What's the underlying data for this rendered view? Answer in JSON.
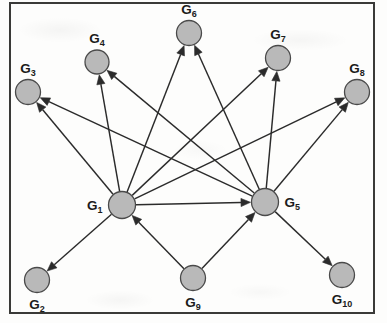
{
  "figure": {
    "kind": "directed-graph-diagram",
    "width": 387,
    "height": 323,
    "background_color": "#fdfdfc",
    "frame": {
      "border_color": "#3a3a38",
      "border_width": 2,
      "x": 9,
      "y": 2,
      "width": 366,
      "height": 312
    },
    "style": {
      "node_fill": "#b9b9b9",
      "node_stroke": "#4a4a4a",
      "edge_color": "#2b2b2b",
      "label_color": "#1b1b1b"
    }
  },
  "graph": {
    "nodes": [
      {
        "id": "G1",
        "base": "G",
        "sub": "1",
        "label": "G1",
        "cx": 122,
        "cy": 205,
        "r": 13.5,
        "label_pos": "left"
      },
      {
        "id": "G2",
        "base": "G",
        "sub": "2",
        "label": "G2",
        "cx": 37,
        "cy": 280,
        "r": 12.5,
        "label_pos": "below"
      },
      {
        "id": "G3",
        "base": "G",
        "sub": "3",
        "label": "G3",
        "cx": 28,
        "cy": 92,
        "r": 12.5,
        "label_pos": "above"
      },
      {
        "id": "G4",
        "base": "G",
        "sub": "4",
        "label": "G4",
        "cx": 97,
        "cy": 62,
        "r": 12.0,
        "label_pos": "above"
      },
      {
        "id": "G5",
        "base": "G",
        "sub": "5",
        "label": "G5",
        "cx": 265,
        "cy": 202,
        "r": 13.5,
        "label_pos": "right"
      },
      {
        "id": "G6",
        "base": "G",
        "sub": "6",
        "label": "G6",
        "cx": 189,
        "cy": 33,
        "r": 12.5,
        "label_pos": "above"
      },
      {
        "id": "G7",
        "base": "G",
        "sub": "7",
        "label": "G7",
        "cx": 278,
        "cy": 58,
        "r": 12.5,
        "label_pos": "above"
      },
      {
        "id": "G8",
        "base": "G",
        "sub": "8",
        "label": "G8",
        "cx": 357,
        "cy": 92,
        "r": 12.5,
        "label_pos": "above"
      },
      {
        "id": "G9",
        "base": "G",
        "sub": "9",
        "label": "G9",
        "cx": 193,
        "cy": 278,
        "r": 12.5,
        "label_pos": "below"
      },
      {
        "id": "G10",
        "base": "G",
        "sub": "10",
        "label": "G10",
        "cx": 342,
        "cy": 275,
        "r": 12.5,
        "label_pos": "below"
      }
    ],
    "edges": [
      {
        "from": "G1",
        "to": "G3",
        "directed": true
      },
      {
        "from": "G1",
        "to": "G4",
        "directed": true
      },
      {
        "from": "G1",
        "to": "G6",
        "directed": true
      },
      {
        "from": "G1",
        "to": "G7",
        "directed": true
      },
      {
        "from": "G1",
        "to": "G8",
        "directed": true
      },
      {
        "from": "G1",
        "to": "G5",
        "directed": true
      },
      {
        "from": "G1",
        "to": "G2",
        "directed": true
      },
      {
        "from": "G5",
        "to": "G3",
        "directed": true
      },
      {
        "from": "G5",
        "to": "G4",
        "directed": true
      },
      {
        "from": "G5",
        "to": "G6",
        "directed": true
      },
      {
        "from": "G5",
        "to": "G7",
        "directed": true
      },
      {
        "from": "G5",
        "to": "G8",
        "directed": true
      },
      {
        "from": "G5",
        "to": "G10",
        "directed": true
      },
      {
        "from": "G9",
        "to": "G1",
        "directed": true
      },
      {
        "from": "G9",
        "to": "G5",
        "directed": true
      }
    ]
  }
}
